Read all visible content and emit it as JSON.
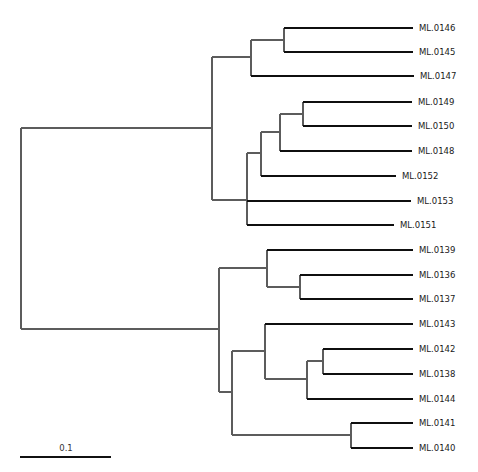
{
  "diagram": {
    "type": "phylogenetic-tree",
    "layout": "rectangular",
    "colors": {
      "internal_branch": "#5c5c5c",
      "leaf_branch": "#0f0f0f",
      "label": "#1a1a1a",
      "background": "#ffffff"
    },
    "scale_bar": {
      "label": "0.1",
      "x1": 20,
      "x2": 111,
      "y": 457,
      "label_x": 66,
      "label_y": 451
    },
    "leaves": [
      {
        "id": "ML.0146",
        "label": "ML.0146",
        "y": 28,
        "x_start": 284,
        "x_end": 413
      },
      {
        "id": "ML.0145",
        "label": "ML.0145",
        "y": 52,
        "x_start": 284,
        "x_end": 413
      },
      {
        "id": "ML.0147",
        "label": "ML.0147",
        "y": 76,
        "x_start": 251,
        "x_end": 414
      },
      {
        "id": "ML.0149",
        "label": "ML.0149",
        "y": 102,
        "x_start": 303,
        "x_end": 412
      },
      {
        "id": "ML.0150",
        "label": "ML.0150",
        "y": 126,
        "x_start": 303,
        "x_end": 412
      },
      {
        "id": "ML.0148",
        "label": "ML.0148",
        "y": 151,
        "x_start": 280,
        "x_end": 412
      },
      {
        "id": "ML.0152",
        "label": "ML.0152",
        "y": 176,
        "x_start": 261,
        "x_end": 396
      },
      {
        "id": "ML.0153",
        "label": "ML.0153",
        "y": 201,
        "x_start": 247,
        "x_end": 411
      },
      {
        "id": "ML.0151",
        "label": "ML.0151",
        "y": 225,
        "x_start": 247,
        "x_end": 394
      },
      {
        "id": "ML.0139",
        "label": "ML.0139",
        "y": 250,
        "x_start": 267,
        "x_end": 413
      },
      {
        "id": "ML.0136",
        "label": "ML.0136",
        "y": 275,
        "x_start": 300,
        "x_end": 413
      },
      {
        "id": "ML.0137",
        "label": "ML.0137",
        "y": 299,
        "x_start": 300,
        "x_end": 413
      },
      {
        "id": "ML.0143",
        "label": "ML.0143",
        "y": 324,
        "x_start": 265,
        "x_end": 413
      },
      {
        "id": "ML.0142",
        "label": "ML.0142",
        "y": 349,
        "x_start": 323,
        "x_end": 413
      },
      {
        "id": "ML.0138",
        "label": "ML.0138",
        "y": 374,
        "x_start": 323,
        "x_end": 413
      },
      {
        "id": "ML.0144",
        "label": "ML.0144",
        "y": 399,
        "x_start": 307,
        "x_end": 413
      },
      {
        "id": "ML.0141",
        "label": "ML.0141",
        "y": 423,
        "x_start": 351,
        "x_end": 413
      },
      {
        "id": "ML.0140",
        "label": "ML.0140",
        "y": 448,
        "x_start": 351,
        "x_end": 413
      }
    ],
    "internal_nodes": [
      {
        "id": "root",
        "x": 21,
        "y_top": 128,
        "y_bottom": 329,
        "parent_x": null,
        "y_mid": 228
      },
      {
        "id": "clade-top",
        "x": 212,
        "y_top": 57,
        "y_bottom": 200,
        "parent_x": 21,
        "y_mid": 128
      },
      {
        "id": "n-145-146-147",
        "x": 251,
        "y_top": 40,
        "y_bottom": 76,
        "parent_x": 212,
        "y_mid": 57
      },
      {
        "id": "n-145-146",
        "x": 284,
        "y_top": 28,
        "y_bottom": 52,
        "parent_x": 251,
        "y_mid": 40
      },
      {
        "id": "n-148-153",
        "x": 247,
        "y_top": 153,
        "y_bottom": 225,
        "parent_x": 212,
        "y_mid": 200
      },
      {
        "id": "n-148-152",
        "x": 261,
        "y_top": 132,
        "y_bottom": 176,
        "parent_x": 247,
        "y_mid": 153
      },
      {
        "id": "n-148-150",
        "x": 280,
        "y_top": 114,
        "y_bottom": 151,
        "parent_x": 261,
        "y_mid": 132
      },
      {
        "id": "n-149-150",
        "x": 303,
        "y_top": 102,
        "y_bottom": 126,
        "parent_x": 280,
        "y_mid": 114
      },
      {
        "id": "clade-bottom",
        "x": 219,
        "y_top": 268,
        "y_bottom": 392,
        "parent_x": 21,
        "y_mid": 329
      },
      {
        "id": "n-136-139",
        "x": 267,
        "y_top": 250,
        "y_bottom": 287,
        "parent_x": 219,
        "y_mid": 268
      },
      {
        "id": "n-136-137",
        "x": 300,
        "y_top": 275,
        "y_bottom": 299,
        "parent_x": 267,
        "y_mid": 287
      },
      {
        "id": "n-138-144",
        "x": 232,
        "y_top": 351,
        "y_bottom": 435,
        "parent_x": 219,
        "y_mid": 392
      },
      {
        "id": "n-143-144",
        "x": 265,
        "y_top": 324,
        "y_bottom": 379,
        "parent_x": 232,
        "y_mid": 351
      },
      {
        "id": "n-142-138-144",
        "x": 307,
        "y_top": 361,
        "y_bottom": 399,
        "parent_x": 265,
        "y_mid": 379
      },
      {
        "id": "n-142-138",
        "x": 323,
        "y_top": 349,
        "y_bottom": 374,
        "parent_x": 307,
        "y_mid": 361
      },
      {
        "id": "n-140-141",
        "x": 351,
        "y_top": 423,
        "y_bottom": 448,
        "parent_x": 232,
        "y_mid": 435
      }
    ]
  }
}
